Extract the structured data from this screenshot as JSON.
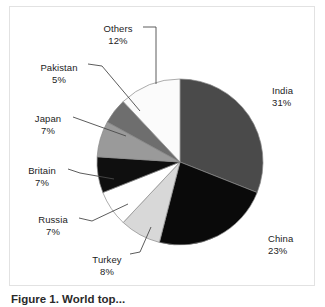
{
  "figure": {
    "caption": "Figure 1. World top...",
    "frame_color": "#e2e2e2",
    "background": "#ffffff"
  },
  "chart_data": {
    "type": "pie",
    "title": "",
    "subtitle": "",
    "xlabel": "",
    "ylabel": "",
    "legend_position": "none",
    "grid": false,
    "label_format": "name + percent",
    "start_angle_deg": 0,
    "direction": "clockwise",
    "categories": [
      "India",
      "China",
      "Turkey",
      "Russia",
      "Britain",
      "Japan",
      "Pakistan",
      "Others"
    ],
    "values": [
      31,
      23,
      8,
      7,
      7,
      7,
      5,
      12
    ],
    "unit": "%",
    "slices": [
      {
        "label": "India",
        "value": 31,
        "value_text": "31%",
        "color": "#4a4a4a",
        "label_side": "right",
        "label_x": 262,
        "label_y": 78
      },
      {
        "label": "China",
        "value": 23,
        "value_text": "23%",
        "color": "#0a0a0a",
        "label_side": "right",
        "label_x": 258,
        "label_y": 226
      },
      {
        "label": "Turkey",
        "value": 8,
        "value_text": "8%",
        "color": "#d8d8d8",
        "label_side": "center",
        "label_x": 84,
        "label_y": 247
      },
      {
        "label": "Russia",
        "value": 7,
        "value_text": "7%",
        "color": "#ffffff",
        "label_side": "left",
        "label_x": 38,
        "label_y": 207
      },
      {
        "label": "Britain",
        "value": 7,
        "value_text": "7%",
        "color": "#0f0f0f",
        "label_side": "left",
        "label_x": 27,
        "label_y": 158
      },
      {
        "label": "Japan",
        "value": 7,
        "value_text": "7%",
        "color": "#9a9a9a",
        "label_side": "left",
        "label_x": 31,
        "label_y": 106
      },
      {
        "label": "Pakistan",
        "value": 5,
        "value_text": "5%",
        "color": "#6e6e6e",
        "label_side": "left",
        "label_x": 40,
        "label_y": 55
      },
      {
        "label": "Others",
        "value": 12,
        "value_text": "12%",
        "color": "#fbfbfb",
        "label_side": "center",
        "label_x": 103,
        "label_y": 16
      }
    ],
    "geometry": {
      "center_x": 180,
      "center_y": 162,
      "radius": 83
    }
  }
}
